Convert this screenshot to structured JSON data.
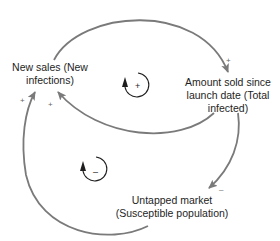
{
  "diagram": {
    "type": "causal-loop-diagram",
    "nodes": [
      {
        "id": "new_sales",
        "lines": [
          "New sales (New",
          "infections)"
        ]
      },
      {
        "id": "amount_sold",
        "lines": [
          "Amount sold since",
          "launch date (Total",
          "infected)"
        ]
      },
      {
        "id": "untapped_market",
        "lines": [
          "Untapped market",
          "(Susceptible population)"
        ]
      }
    ],
    "links": [
      {
        "from": "new_sales",
        "to": "amount_sold",
        "polarity": "+"
      },
      {
        "from": "amount_sold",
        "to": "new_sales",
        "polarity": "+"
      },
      {
        "from": "amount_sold",
        "to": "untapped_market",
        "polarity": "–"
      },
      {
        "from": "untapped_market",
        "to": "new_sales",
        "polarity": "+"
      }
    ],
    "loops": [
      {
        "id": "reinforcing",
        "symbol": "+"
      },
      {
        "id": "balancing",
        "symbol": "–"
      }
    ]
  },
  "colors": {
    "arrow": "#7a7a7a",
    "loop_marker": "#1e1e1e",
    "text": "#1e1e1e"
  }
}
